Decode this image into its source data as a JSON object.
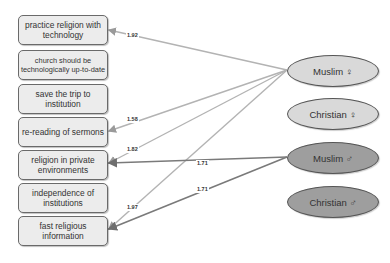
{
  "diagram": {
    "boxes": [
      {
        "label": "practice religion with technology"
      },
      {
        "label": "church should be technologically up-to-date"
      },
      {
        "label": "save the trip to institution"
      },
      {
        "label": "re-reading of sermons"
      },
      {
        "label": "religion in private environments"
      },
      {
        "label": "independence of institutions"
      },
      {
        "label": "fast religious information"
      }
    ],
    "groups": [
      {
        "label": "Muslim ♀",
        "color": "#d9d9d9"
      },
      {
        "label": "Christian ♀",
        "color": "#d9d9d9"
      },
      {
        "label": "Muslim ♂",
        "color": "#9e9e9e"
      },
      {
        "label": "Christian ♂",
        "color": "#9e9e9e"
      }
    ],
    "edges": [
      {
        "from": "Muslim ♀",
        "to": "practice religion with technology",
        "label": "1.92"
      },
      {
        "from": "Muslim ♀",
        "to": "re-reading of sermons",
        "label": "1.58"
      },
      {
        "from": "Muslim ♀",
        "to": "religion in private environments",
        "label": "1.82"
      },
      {
        "from": "Muslim ♀",
        "to": "fast religious information",
        "label": "1.97"
      },
      {
        "from": "Muslim ♂",
        "to": "religion in private environments",
        "label": "1.71"
      },
      {
        "from": "Muslim ♂",
        "to": "fast religious information",
        "label": "1.71"
      }
    ],
    "colors": {
      "box_fill": "#ececec",
      "box_border": "#6a6a6a",
      "edge_light": "#b0b0b0",
      "edge_dark": "#7a7a7a",
      "female_fill": "#d9d9d9",
      "male_fill": "#9e9e9e"
    }
  }
}
